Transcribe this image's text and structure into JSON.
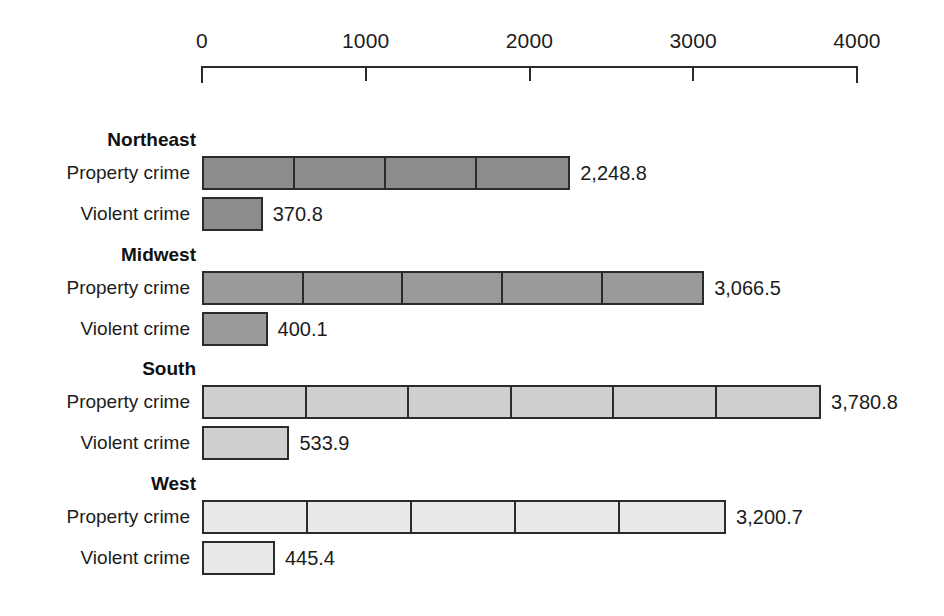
{
  "chart_data": {
    "type": "bar",
    "orientation": "horizontal",
    "title": "",
    "subtitle": "",
    "xlabel": "",
    "ylabel": "",
    "xlim": [
      0,
      4000
    ],
    "grid": false,
    "legend": null,
    "axis": {
      "ticks": [
        0,
        1000,
        2000,
        3000,
        4000
      ],
      "tick_labels": [
        "0",
        "1000",
        "2000",
        "3000",
        "4000"
      ],
      "position": "top"
    },
    "categories": [
      "Northeast",
      "Midwest",
      "South",
      "West"
    ],
    "series": [
      {
        "name": "Property crime",
        "values": [
          2248.8,
          3066.5,
          3780.8,
          3200.7
        ],
        "value_labels": [
          "2,248.8",
          "3,066.5",
          "3,780.8",
          "3,200.7"
        ]
      },
      {
        "name": "Violent crime",
        "values": [
          370.8,
          400.1,
          533.9,
          445.4
        ],
        "value_labels": [
          "370.8",
          "400.1",
          "533.9",
          "445.4"
        ]
      }
    ],
    "groups": [
      {
        "region": "Northeast",
        "fill": "#8c8c8c",
        "segments_property": 4,
        "segments_violent": 1,
        "rows": [
          {
            "label": "Property crime",
            "value": 2248.8,
            "value_label": "2,248.8"
          },
          {
            "label": "Violent crime",
            "value": 370.8,
            "value_label": "370.8"
          }
        ]
      },
      {
        "region": "Midwest",
        "fill": "#9a9a9a",
        "segments_property": 5,
        "segments_violent": 1,
        "rows": [
          {
            "label": "Property crime",
            "value": 3066.5,
            "value_label": "3,066.5"
          },
          {
            "label": "Violent crime",
            "value": 400.1,
            "value_label": "400.1"
          }
        ]
      },
      {
        "region": "South",
        "fill": "#cfcfcf",
        "segments_property": 6,
        "segments_violent": 1,
        "rows": [
          {
            "label": "Property crime",
            "value": 3780.8,
            "value_label": "3,780.8"
          },
          {
            "label": "Violent crime",
            "value": 533.9,
            "value_label": "533.9"
          }
        ]
      },
      {
        "region": "West",
        "fill": "#e9e9e9",
        "segments_property": 5,
        "segments_violent": 1,
        "rows": [
          {
            "label": "Property crime",
            "value": 3200.7,
            "value_label": "3,200.7"
          },
          {
            "label": "Violent crime",
            "value": 445.4,
            "value_label": "445.4"
          }
        ]
      }
    ],
    "colors": {
      "northeast": "#8c8c8c",
      "midwest": "#9a9a9a",
      "south": "#cfcfcf",
      "west": "#e9e9e9",
      "outline": "#2b2b2b",
      "text": "#1c1c1c",
      "background": "#ffffff"
    }
  }
}
